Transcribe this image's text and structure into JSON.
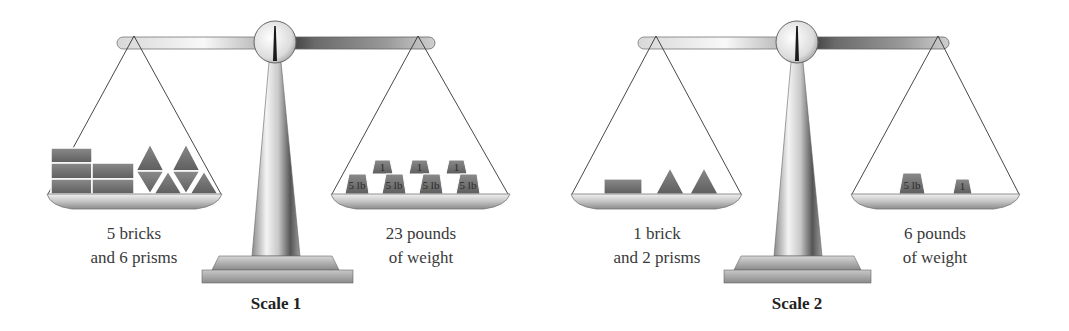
{
  "scales": [
    {
      "title": "Scale 1",
      "left_label": [
        "5 bricks",
        "and 6 prisms"
      ],
      "right_label": [
        "23 pounds",
        "of weight"
      ],
      "left_contents": {
        "bricks": 5,
        "prisms": 6
      },
      "right_contents": {
        "weights_top": [
          "1",
          "1",
          "1"
        ],
        "weights_bottom": [
          "5 lb",
          "5 lb",
          "5 lb",
          "5 lb"
        ]
      }
    },
    {
      "title": "Scale 2",
      "left_label": [
        "1 brick",
        "and 2 prisms"
      ],
      "right_label": [
        "6 pounds",
        "of weight"
      ],
      "left_contents": {
        "bricks": 1,
        "prisms": 2
      },
      "right_contents": {
        "weights": [
          "5 lb",
          "1"
        ]
      }
    }
  ],
  "colors": {
    "object_fill": "#6e6e6e",
    "object_edge": "#4a4a4a",
    "metal_light": "#f2f2f2",
    "metal_dark": "#8a8a8a",
    "string": "#333333"
  }
}
